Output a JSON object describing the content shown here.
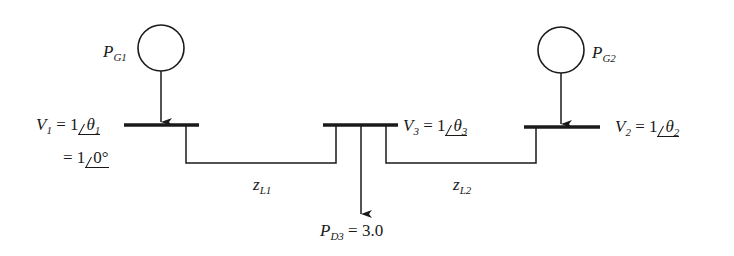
{
  "diagram": {
    "type": "three-bus power system one-line diagram",
    "colors": {
      "line": "#1a1a1a",
      "background": "#ffffff"
    },
    "generators": [
      {
        "id": "G1",
        "label": "P",
        "subscript": "G1"
      },
      {
        "id": "G2",
        "label": "P",
        "subscript": "G2"
      }
    ],
    "buses": [
      {
        "id": "bus1",
        "voltage_label": "V",
        "voltage_sub": "1",
        "eq": "= 1",
        "angle": "θ",
        "angle_sub": "1",
        "second_line_eq": "= 1",
        "second_line_angle": "0°"
      },
      {
        "id": "bus3",
        "voltage_label": "V",
        "voltage_sub": "3",
        "eq": "= 1",
        "angle": "θ",
        "angle_sub": "3"
      },
      {
        "id": "bus2",
        "voltage_label": "V",
        "voltage_sub": "2",
        "eq": "= 1",
        "angle": "θ",
        "angle_sub": "2"
      }
    ],
    "lines": [
      {
        "id": "L1",
        "label": "z",
        "subscript": "L1"
      },
      {
        "id": "L2",
        "label": "z",
        "subscript": "L2"
      }
    ],
    "load": {
      "label": "P",
      "subscript": "D3",
      "value": "= 3.0"
    }
  }
}
